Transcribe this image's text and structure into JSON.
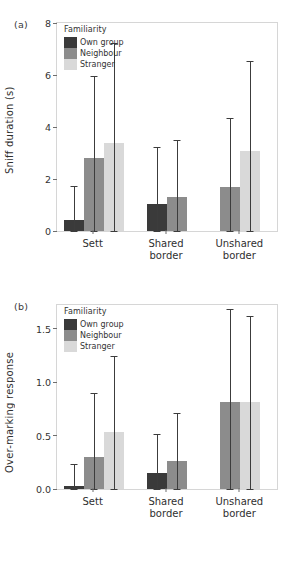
{
  "figure": {
    "panel_a_tag": "(a)",
    "panel_b_tag": "(b)"
  },
  "legend": {
    "title": "Familiarity",
    "items": [
      {
        "label": "Own group",
        "color": "#3a3a3a"
      },
      {
        "label": "Neighbour",
        "color": "#8c8c8c"
      },
      {
        "label": "Stranger",
        "color": "#d9d9d9"
      }
    ]
  },
  "chart_data": [
    {
      "type": "bar",
      "panel": "(a)",
      "title": "",
      "xlabel": "",
      "ylabel": "Sniff duration (s)",
      "categories": [
        "Sett",
        "Shared\nborder",
        "Unshared\nborder"
      ],
      "category_labels": [
        "Sett",
        "Shared border",
        "Unshared border"
      ],
      "ylim": [
        0,
        8
      ],
      "yticks": [
        0,
        2,
        4,
        6,
        8
      ],
      "ytick_labels": [
        "0",
        "2",
        "4",
        "6",
        "8"
      ],
      "grid": false,
      "legend_position": "top-left",
      "series": [
        {
          "name": "Own group",
          "color": "#3a3a3a",
          "values": [
            0.42,
            1.05,
            null
          ],
          "err_low": [
            0.0,
            0.0,
            null
          ],
          "err_high": [
            1.73,
            3.25,
            null
          ]
        },
        {
          "name": "Neighbour",
          "color": "#8c8c8c",
          "values": [
            2.8,
            1.3,
            1.7
          ],
          "err_low": [
            0.0,
            0.0,
            0.0
          ],
          "err_high": [
            5.95,
            3.5,
            4.35
          ]
        },
        {
          "name": "Stranger",
          "color": "#d9d9d9",
          "values": [
            3.37,
            null,
            3.08
          ],
          "err_low": [
            0.0,
            null,
            0.0
          ],
          "err_high": [
            7.25,
            null,
            6.55
          ]
        }
      ]
    },
    {
      "type": "bar",
      "panel": "(b)",
      "title": "",
      "xlabel": "",
      "ylabel": "Over-marking response",
      "categories": [
        "Sett",
        "Shared\nborder",
        "Unshared\nborder"
      ],
      "category_labels": [
        "Sett",
        "Shared border",
        "Unshared border"
      ],
      "ylim": [
        0,
        1.72
      ],
      "yticks": [
        0.0,
        0.5,
        1.0,
        1.5
      ],
      "ytick_labels": [
        "0.0",
        "0.5",
        "1.0",
        "1.5"
      ],
      "grid": false,
      "legend_position": "top-left",
      "series": [
        {
          "name": "Own group",
          "color": "#3a3a3a",
          "values": [
            0.03,
            0.15,
            null
          ],
          "err_low": [
            0.0,
            0.0,
            null
          ],
          "err_high": [
            0.23,
            0.51,
            null
          ]
        },
        {
          "name": "Neighbour",
          "color": "#8c8c8c",
          "values": [
            0.3,
            0.26,
            0.81
          ],
          "err_low": [
            0.0,
            0.0,
            0.0
          ],
          "err_high": [
            0.9,
            0.71,
            1.68
          ]
        },
        {
          "name": "Stranger",
          "color": "#d9d9d9",
          "values": [
            0.53,
            null,
            0.81
          ],
          "err_low": [
            0.0,
            null,
            0.0
          ],
          "err_high": [
            1.24,
            null,
            1.62
          ]
        }
      ]
    }
  ]
}
